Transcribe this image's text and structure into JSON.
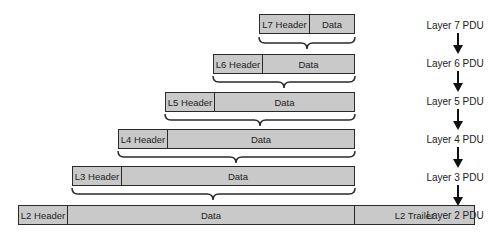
{
  "diagram": {
    "pdus": [
      {
        "layer": 7,
        "header": "L7 Header",
        "data": "Data",
        "trailer": null
      },
      {
        "layer": 6,
        "header": "L6 Header",
        "data": "Data",
        "trailer": null
      },
      {
        "layer": 5,
        "header": "L5 Header",
        "data": "Data",
        "trailer": null
      },
      {
        "layer": 4,
        "header": "L4 Header",
        "data": "Data",
        "trailer": null
      },
      {
        "layer": 3,
        "header": "L3 Header",
        "data": "Data",
        "trailer": null
      },
      {
        "layer": 2,
        "header": "L2 Header",
        "data": "Data",
        "trailer": "L2 Trailer"
      }
    ],
    "labels": [
      "Layer 7 PDU",
      "Layer 6 PDU",
      "Layer 5 PDU",
      "Layer 4 PDU",
      "Layer 3 PDU",
      "Layer 2 PDU"
    ],
    "colors": {
      "box_fill": "#c9c9c9",
      "stroke": "#2a2a2a",
      "text": "#222222"
    }
  }
}
